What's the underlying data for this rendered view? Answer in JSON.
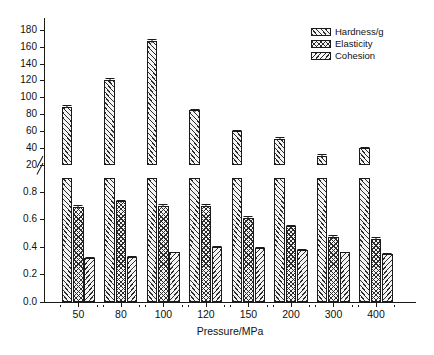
{
  "chart_data": {
    "type": "bar",
    "title": "",
    "subtitle": "",
    "xlabel": "Pressure/MPa",
    "ylabel": "",
    "categories": [
      "50",
      "80",
      "100",
      "120",
      "150",
      "200",
      "300",
      "400"
    ],
    "grid": false,
    "legend_position": "top-right",
    "broken_axis": true,
    "axis_break_note": "y-axis is broken between 0.9 and 20",
    "upper_axis": {
      "label": "",
      "ticks": [
        "20",
        "40",
        "60",
        "80",
        "100",
        "120",
        "140",
        "160",
        "180"
      ],
      "tick_values": [
        20,
        40,
        60,
        80,
        100,
        120,
        140,
        160,
        180
      ],
      "ylim": [
        20,
        188
      ]
    },
    "lower_axis": {
      "label": "",
      "ticks": [
        "0.0",
        "0.2",
        "0.4",
        "0.6",
        "0.8"
      ],
      "tick_values": [
        0.0,
        0.2,
        0.4,
        0.6,
        0.8
      ],
      "ylim": [
        0.0,
        0.9
      ]
    },
    "series": [
      {
        "name": "Hardness/g",
        "axis": "upper",
        "pattern": "diagonal-forward-hatch",
        "values": [
          89,
          120,
          167,
          85,
          60,
          51,
          31,
          40
        ],
        "errors": [
          1.5,
          2.5,
          2.5,
          1.8,
          1.2,
          2.0,
          2.0,
          1.2
        ]
      },
      {
        "name": "Elasticity",
        "axis": "lower",
        "pattern": "crosshatch",
        "values": [
          0.69,
          0.73,
          0.7,
          0.7,
          0.61,
          0.55,
          0.47,
          0.46
        ],
        "errors": [
          0.012,
          0.008,
          0.01,
          0.012,
          0.014,
          0.008,
          0.014,
          0.012
        ]
      },
      {
        "name": "Cohesion",
        "axis": "lower",
        "pattern": "diagonal-back-hatch",
        "values": [
          0.32,
          0.33,
          0.36,
          0.4,
          0.39,
          0.38,
          0.36,
          0.35
        ],
        "errors": [
          0.006,
          0.006,
          0.006,
          0.008,
          0.008,
          0.008,
          0.006,
          0.006
        ]
      }
    ]
  },
  "legend": {
    "items": [
      {
        "label": "Hardness/g"
      },
      {
        "label": "Elasticity"
      },
      {
        "label": "Cohesion"
      }
    ]
  },
  "axes": {
    "x_title": "Pressure/MPa"
  },
  "caption": {
    "text": ""
  },
  "colors": {
    "ink": "#1a1a1a",
    "hatch": "#2b2b2b",
    "bar_fill": "#f4f4f4",
    "background": "#ffffff"
  }
}
